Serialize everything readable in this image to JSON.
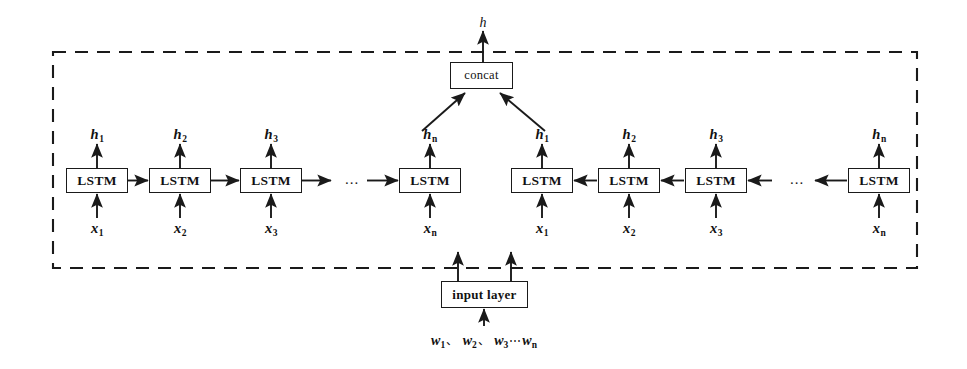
{
  "figure": {
    "type": "bidirectional-lstm-architecture-diagram",
    "background_color": "#ffffff",
    "stroke_color": "#1a1a1a",
    "dashed_border": {
      "name": "bilstm-module-boundary",
      "x": 53,
      "y": 52,
      "width": 864,
      "height": 216,
      "style": "dashed"
    }
  },
  "output": {
    "top_label": "h"
  },
  "concat": {
    "label": "concat"
  },
  "input_layer": {
    "label": "input layer",
    "words_label_parts": {
      "w1": "w",
      "s1": "1",
      "sep1": "、",
      "w2": "w",
      "s2": "2",
      "sep2": "、",
      "w3": "w",
      "s3": "3",
      "dots": "⋯",
      "wn": "w",
      "sn": "n"
    }
  },
  "forward_chain": {
    "name": "forward-lstm-chain",
    "direction": "left-to-right",
    "cells": [
      {
        "box_label": "LSTM",
        "x": 66,
        "h_label": "h",
        "h_sub": "1",
        "x_label": "x",
        "x_sub": "1"
      },
      {
        "box_label": "LSTM",
        "x": 149,
        "h_label": "h",
        "h_sub": "2",
        "x_label": "x",
        "x_sub": "2"
      },
      {
        "box_label": "LSTM",
        "x": 240,
        "h_label": "h",
        "h_sub": "3",
        "x_label": "x",
        "x_sub": "3"
      },
      {
        "box_label": "LSTM",
        "x": 399,
        "h_label": "h",
        "h_sub": "n",
        "x_label": "x",
        "x_sub": "n"
      }
    ],
    "ellipsis": {
      "text": "...",
      "x": 352,
      "y": 180
    }
  },
  "backward_chain": {
    "name": "backward-lstm-chain",
    "direction": "right-to-left",
    "cells": [
      {
        "box_label": "LSTM",
        "x": 511,
        "h_label": "h",
        "h_sub": "1",
        "x_label": "x",
        "x_sub": "1"
      },
      {
        "box_label": "LSTM",
        "x": 598,
        "h_label": "h",
        "h_sub": "2",
        "x_label": "x",
        "x_sub": "2"
      },
      {
        "box_label": "LSTM",
        "x": 685,
        "h_label": "h",
        "h_sub": "3",
        "x_label": "x",
        "x_sub": "3"
      },
      {
        "box_label": "LSTM",
        "x": 848,
        "h_label": "h",
        "h_sub": "n",
        "x_label": "x",
        "x_sub": "n"
      }
    ],
    "ellipsis": {
      "text": "...",
      "x": 797,
      "y": 180
    }
  }
}
